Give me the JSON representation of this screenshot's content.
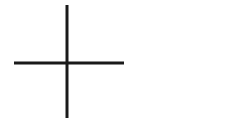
{
  "canvas": {
    "width": 231,
    "height": 120,
    "background_color": "#ffffff",
    "title": "Plus sign"
  },
  "drawing": {
    "name": "plus-sign",
    "description": "Hand-drawn black plus / cross sign on a plain white background",
    "ink_color": "#1a1a1a",
    "stroke_width": 3,
    "intersection": {
      "x": 67,
      "y": 63
    },
    "strokes": [
      {
        "name": "vertical-stroke",
        "orientation": "vertical",
        "x1": 67,
        "y1": 5,
        "x2": 67,
        "y2": 118,
        "length": 113,
        "width": 3,
        "color": "#1a1a1a"
      },
      {
        "name": "horizontal-stroke",
        "orientation": "horizontal",
        "x1": 14,
        "y1": 63,
        "x2": 124,
        "y2": 63,
        "length": 110,
        "width": 3,
        "color": "#1a1a1a"
      }
    ]
  }
}
